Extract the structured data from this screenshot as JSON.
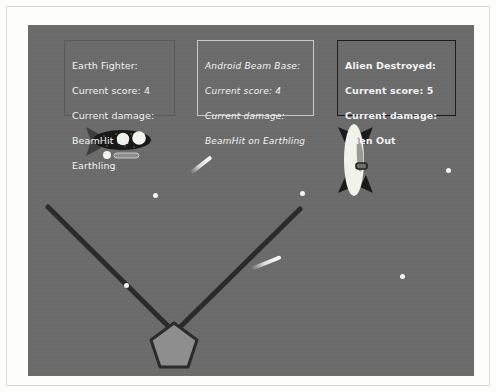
{
  "canvas": {
    "background_color": "#6b6b6b",
    "width": 446,
    "height": 351
  },
  "hud": {
    "panels": [
      {
        "name": "earth-fighter",
        "border_color": "#5a5a5a",
        "text_color": "#f2f2f2",
        "lines": [
          "Earth Fighter:",
          "Current score: 4",
          "Current damage:",
          "BeamHit on",
          "Earthling"
        ],
        "title": "Earth Fighter:",
        "current_score_label": "Current score: 4",
        "current_damage_label": "Current damage:",
        "damage_line_1": "BeamHit on",
        "damage_line_2": "Earthling",
        "score": 4
      },
      {
        "name": "android-beam-base",
        "border_color": "#c9c9c9",
        "text_color": "#f2f2f2",
        "lines": [
          "Android Beam Base:",
          "Current score: 4",
          "Current damage:",
          "BeamHit on Earthling"
        ],
        "title": "Android Beam Base:",
        "current_score_label": "Current score: 4",
        "current_damage_label": "Current damage:",
        "damage_line_1": "BeamHit on Earthling",
        "score": 4
      },
      {
        "name": "alien-destroyed",
        "border_color": "#1c1c1c",
        "text_color": "#f2f2f2",
        "lines": [
          "Alien Destroyed:",
          "Current score: 5",
          "Current damage:",
          "Alien Out"
        ],
        "title": "Alien Destroyed:",
        "current_score_label": "Current score: 5",
        "current_damage_label": "Current damage:",
        "damage_line_1": "Alien Out",
        "score": 5
      }
    ]
  },
  "sprites": {
    "earth_fighter": {
      "name": "earth-fighter-ship",
      "body_color": "#1b1b1b",
      "window_color": "#efefe9",
      "fin_color": "#3a3a3a",
      "cannon_color": "#9c9c9c"
    },
    "alien": {
      "name": "alien-ship",
      "body_color": "#f2f2ec",
      "inner_color": "#9a9a96",
      "fin_color": "#1b1b1b",
      "port_color": "#2a2a2a"
    }
  },
  "beams": {
    "color": "#2b2b2b",
    "left_beam": {
      "x1": 20,
      "y1": 182,
      "x2": 147,
      "y2": 308
    },
    "right_beam": {
      "x1": 272,
      "y1": 184,
      "x2": 145,
      "y2": 309
    }
  },
  "base": {
    "name": "android-beam-base-pentagon",
    "fill_color": "#8e8e8e",
    "stroke_color": "#2b2b2b",
    "center_x": 146,
    "center_y": 322,
    "radius": 24
  },
  "stars": [
    {
      "x": 125,
      "y": 168
    },
    {
      "x": 272,
      "y": 166
    },
    {
      "x": 418,
      "y": 143
    },
    {
      "x": 96,
      "y": 258
    },
    {
      "x": 372,
      "y": 249
    }
  ],
  "comets": [
    {
      "x": 160,
      "y": 138,
      "length": 26,
      "angle": -38
    },
    {
      "x": 222,
      "y": 236,
      "length": 32,
      "angle": -22
    }
  ]
}
